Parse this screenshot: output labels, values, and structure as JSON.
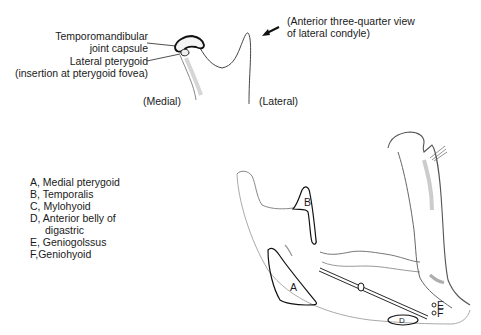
{
  "top_view": {
    "caption": [
      "(Anterior three-quarter view",
      "of lateral condyle)"
    ],
    "labels": {
      "tmj_capsule": [
        "Temporomandibular",
        "joint capsule"
      ],
      "lateral_pterygoid": [
        "Lateral pterygoid",
        "(insertion at pterygoid fovea)"
      ],
      "medial": "(Medial)",
      "lateral": "(Lateral)"
    }
  },
  "legend": {
    "items": [
      {
        "key": "A",
        "text": "A, Medial pterygoid"
      },
      {
        "key": "B",
        "text": "B, Temporalis"
      },
      {
        "key": "C",
        "text": "C, Mylohyoid"
      },
      {
        "key": "D",
        "text": "D,  Anterior  belly  of",
        "continuation": "digastric"
      },
      {
        "key": "E",
        "text": "E, Geniogolssus"
      },
      {
        "key": "F",
        "text": "F,Geniohyoid"
      }
    ]
  },
  "markers": {
    "A": "A",
    "B": "B",
    "C": "C",
    "D": "D",
    "E": "E",
    "F": "F"
  }
}
